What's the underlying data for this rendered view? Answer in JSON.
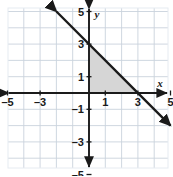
{
  "figure": {
    "name": "coordinate-plane-graph",
    "width": 173,
    "height": 176,
    "background_color": "#ffffff"
  },
  "chart_data": {
    "type": "line",
    "title": "",
    "xlabel": "x",
    "ylabel": "y",
    "xlim": [
      -5.8,
      5.2
    ],
    "ylim": [
      -5.8,
      5.2
    ],
    "grid": true,
    "grid_step": 1,
    "legend": "none",
    "axis_labels": {
      "x_axis_name": "x",
      "y_axis_name": "y"
    },
    "x_ticks": [
      -5,
      -3,
      1,
      3,
      5
    ],
    "x_tick_labels": [
      "–5",
      "–3",
      "1",
      "3",
      "5"
    ],
    "y_ticks": [
      5,
      3,
      1,
      -1,
      -3,
      -5
    ],
    "y_tick_labels": [
      "5",
      "3",
      "1",
      "–1",
      "–3",
      "–5"
    ],
    "series": [
      {
        "name": "line",
        "type": "line",
        "equation": "y = -x + 3",
        "slope": -1,
        "y_intercept": 3,
        "x_intercept": 3,
        "points": [
          [
            -2,
            5
          ],
          [
            0,
            3
          ],
          [
            3,
            0
          ],
          [
            5,
            -2
          ]
        ],
        "color": "#1a1a1a",
        "arrows": "both"
      }
    ],
    "shaded_regions": [
      {
        "name": "shaded-triangle",
        "vertices": [
          [
            0,
            0
          ],
          [
            0,
            3
          ],
          [
            3,
            0
          ]
        ],
        "fill": "#d6d6d6",
        "description": "right triangle bounded by x-axis, y-axis, and the line"
      }
    ],
    "colors": {
      "axis": "#1a1a1a",
      "line": "#1a1a1a",
      "grid_major": "#c9d2dd",
      "grid_minor": "#e6ebf1",
      "shade": "#d6d6d6"
    }
  }
}
